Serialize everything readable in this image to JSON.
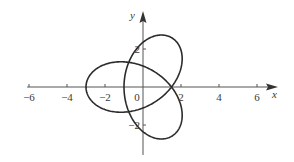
{
  "chart_data": {
    "type": "line",
    "title": "",
    "xlabel": "x",
    "ylabel": "y",
    "xlim": [
      -6.5,
      7
    ],
    "ylim": [
      -3.6,
      3.8
    ],
    "grid": false,
    "legend": null,
    "x_ticks": [
      -6,
      -4,
      -2,
      0,
      2,
      4,
      6
    ],
    "x_tick_labels": [
      "−6",
      "−4",
      "−2",
      "0",
      "2",
      "4",
      "6"
    ],
    "y_ticks": [
      -2,
      2
    ],
    "y_tick_labels": [
      "−2",
      "2"
    ],
    "origin_label": "0",
    "series": [
      {
        "name": "three-lobed parametric curve",
        "parametric": "x = -cos t - 2cos 2t, y = sin t - 2sin 2t, 0 ≤ t ≤ 2π",
        "key_points": [
          {
            "label": "left lobe tip",
            "x": -3,
            "y": 0
          },
          {
            "label": "upper lobe tip",
            "x": 1.5,
            "y": 2.6
          },
          {
            "label": "lower lobe tip",
            "x": 1.5,
            "y": -2.6
          },
          {
            "label": "self-intersection",
            "x": 1.5,
            "y": 0
          },
          {
            "label": "self-intersection",
            "x": -0.75,
            "y": 1.3
          },
          {
            "label": "self-intersection",
            "x": -0.75,
            "y": -1.3
          }
        ],
        "color": "#2b2b2b"
      }
    ]
  },
  "axes": {
    "x_label": "x",
    "y_label": "y",
    "origin_label": "0"
  },
  "colors": {
    "curve": "#2b2b2b",
    "axis": "#555555",
    "background": "#ffffff"
  }
}
